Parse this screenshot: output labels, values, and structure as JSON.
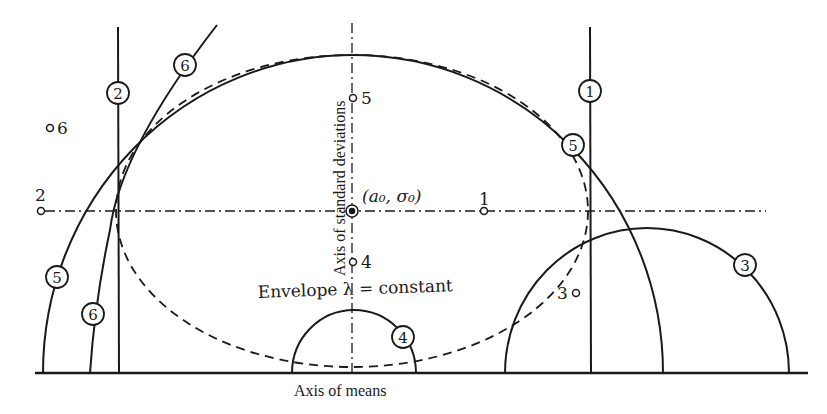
{
  "figure": {
    "axes": {
      "horizontal_label": "Axis of means",
      "vertical_label": "Axis of standard deviations"
    },
    "center_point_label": "(a₀, σ₀)",
    "envelope_label": "Envelope λ = constant",
    "points": [
      {
        "id": "1",
        "label": "1"
      },
      {
        "id": "2",
        "label": "2"
      },
      {
        "id": "3",
        "label": "3"
      },
      {
        "id": "4",
        "label": "4"
      },
      {
        "id": "5",
        "label": "5"
      },
      {
        "id": "6",
        "label": "6"
      }
    ],
    "curve_markers": [
      {
        "id": "1",
        "label": "1"
      },
      {
        "id": "2",
        "label": "2"
      },
      {
        "id": "3",
        "label": "3"
      },
      {
        "id": "4",
        "label": "4"
      },
      {
        "id": "5a",
        "label": "5"
      },
      {
        "id": "5b",
        "label": "5"
      },
      {
        "id": "6a",
        "label": "6"
      },
      {
        "id": "6b",
        "label": "6"
      }
    ],
    "colors": {
      "ink": "#1a1a1a",
      "background": "#ffffff"
    }
  }
}
